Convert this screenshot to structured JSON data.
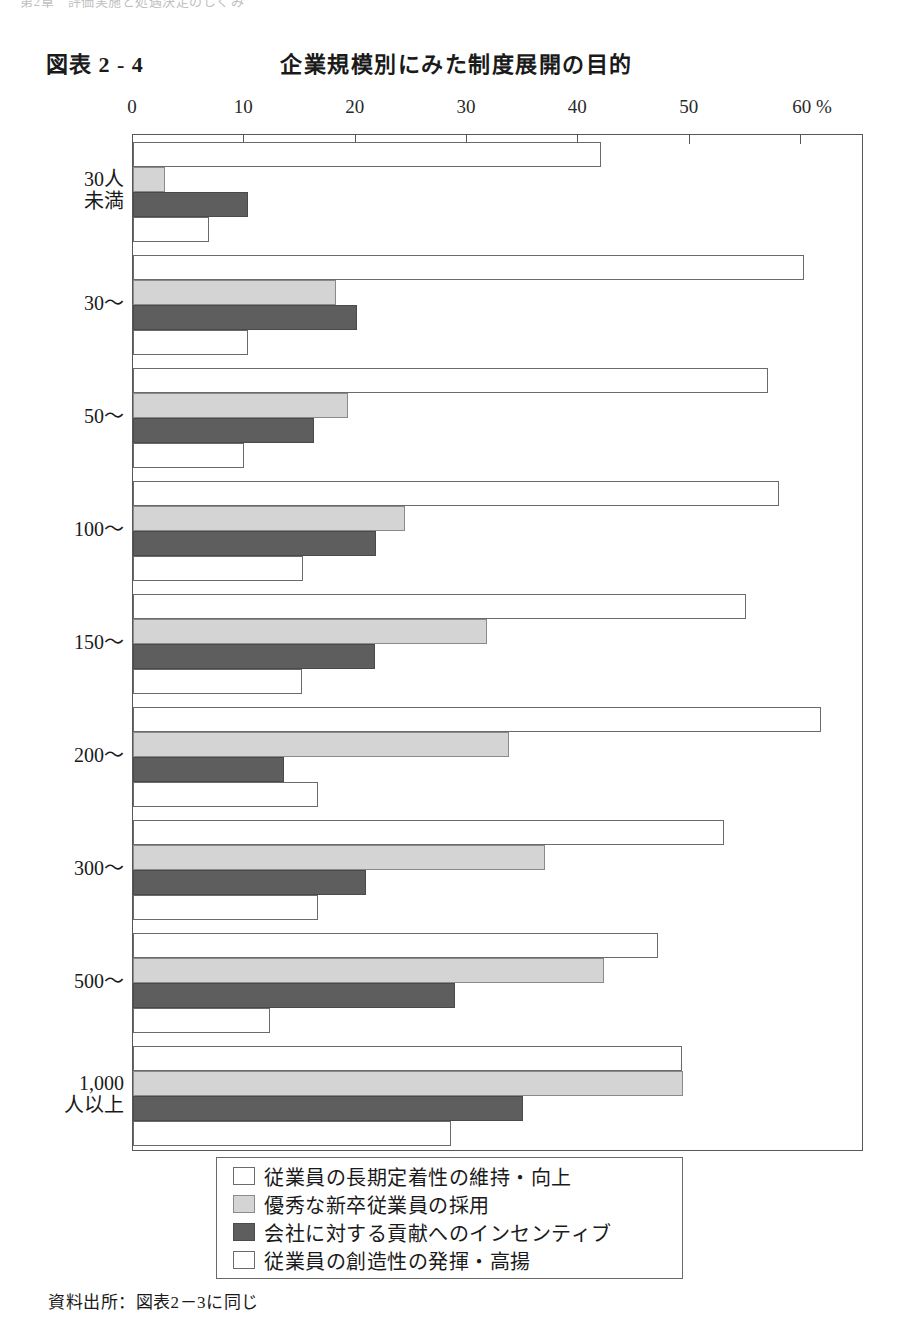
{
  "page": {
    "running_header": "第2章　評価実施と処遇決定のしくみ",
    "source_note": "資料出所：図表2－3に同じ"
  },
  "figure": {
    "number": "図表 2 - 4",
    "title": "企業規模別にみた制度展開の目的"
  },
  "chart_data": {
    "type": "bar",
    "orientation": "horizontal",
    "title": "企業規模別にみた制度展開の目的",
    "xlabel": "",
    "ylabel": "",
    "unit": "%",
    "unit_label": "60 %",
    "xlim": [
      0,
      60
    ],
    "xticks": [
      0,
      10,
      20,
      30,
      40,
      50,
      60
    ],
    "xtick_labels": [
      "0",
      "10",
      "20",
      "30",
      "40",
      "50",
      "60 %"
    ],
    "grid": false,
    "legend_position": "bottom",
    "categories": [
      "30人\n未満",
      "30～",
      "50～",
      "100～",
      "150～",
      "200～",
      "300～",
      "500～",
      "1,000\n人以上"
    ],
    "series": [
      {
        "name": "従業員の長期定着性の維持・向上",
        "color": "#ffffff",
        "values": [
          42.0,
          60.3,
          57.0,
          58.0,
          55.1,
          61.8,
          53.1,
          47.2,
          49.3
        ]
      },
      {
        "name": "優秀な新卒従業員の採用",
        "color": "#d4d4d4",
        "values": [
          2.9,
          18.2,
          19.3,
          24.4,
          31.8,
          33.8,
          37.0,
          42.3,
          49.4
        ]
      },
      {
        "name": "会社に対する貢献へのインセンティブ",
        "color": "#5e5e5e",
        "values": [
          10.3,
          20.1,
          16.3,
          21.8,
          21.7,
          13.6,
          20.9,
          28.9,
          35.0
        ]
      },
      {
        "name": "従業員の創造性の発揮・高揚",
        "color": "#ffffff",
        "values": [
          6.8,
          10.3,
          10.0,
          15.3,
          15.2,
          16.6,
          16.6,
          12.3,
          28.6
        ]
      }
    ]
  }
}
